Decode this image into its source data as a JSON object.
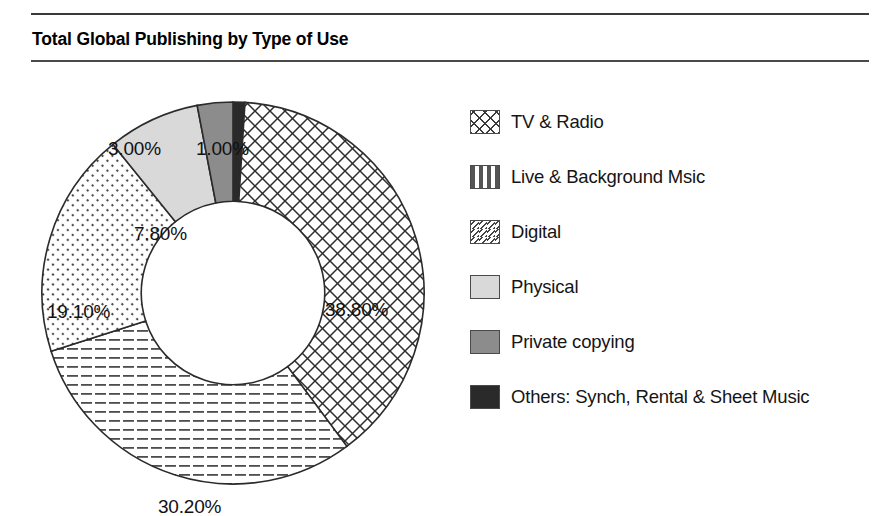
{
  "header": {
    "title": "Total Global Publishing by Type of Use"
  },
  "chart_data": {
    "type": "pie",
    "variant": "donut",
    "title": "Total Global Publishing by Type of Use",
    "xlabel": "",
    "ylabel": "",
    "units": "percent",
    "start_angle_deg": 0,
    "direction": "clockwise",
    "inner_radius_ratio": 0.48,
    "legend_position": "right",
    "grid": false,
    "categories": [
      "TV & Radio",
      "Live & Background Msic",
      "Digital",
      "Physical",
      "Private copying",
      "Others: Synch, Rental & Sheet Music"
    ],
    "values": [
      38.8,
      30.2,
      19.1,
      7.8,
      3.0,
      1.0
    ],
    "labels": [
      "38.80%",
      "30.20%",
      "19.10%",
      "7.80%",
      "3.00%",
      "1.00%"
    ],
    "slices": [
      {
        "name": "Others: Synch, Rental & Sheet Music",
        "value": 1.0,
        "label": "1.00%",
        "fill": "solid-black",
        "color": "#2a2a2a"
      },
      {
        "name": "TV & Radio",
        "value": 38.8,
        "label": "38.80%",
        "fill": "crosshatch",
        "color": "#ffffff"
      },
      {
        "name": "Live & Background Msic",
        "value": 30.2,
        "label": "30.20%",
        "fill": "horizontal-dashes",
        "color": "#ffffff"
      },
      {
        "name": "Digital",
        "value": 19.1,
        "label": "19.10%",
        "fill": "dotted-diagonal",
        "color": "#ffffff"
      },
      {
        "name": "Physical",
        "value": 7.8,
        "label": "7.80%",
        "fill": "solid-light-gray",
        "color": "#d9d9d9"
      },
      {
        "name": "Private copying",
        "value": 3.0,
        "label": "3.00%",
        "fill": "solid-mid-gray",
        "color": "#8c8c8c"
      }
    ]
  },
  "legend": {
    "items": [
      {
        "label": "TV & Radio",
        "swatch": "crosshatch-swatch"
      },
      {
        "label": "Live & Background Msic",
        "swatch": "dashes-swatch"
      },
      {
        "label": "Digital",
        "swatch": "dotted-diagonal-swatch"
      },
      {
        "label": "Physical",
        "swatch": "light-gray-swatch"
      },
      {
        "label": "Private copying",
        "swatch": "mid-gray-swatch"
      },
      {
        "label": "Others: Synch, Rental & Sheet Music",
        "swatch": "black-swatch"
      }
    ]
  }
}
